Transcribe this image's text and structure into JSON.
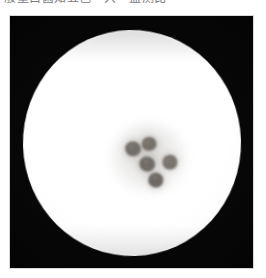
{
  "caption": {
    "text": "般量白菌知五色一只—监测比",
    "note": "clipped-top-text-line"
  },
  "photo": {
    "subject": "petri-dish-bacterial-culture",
    "frame_color": "#040404",
    "dish_color": "#ffffff",
    "colony_color": "#6f6a66",
    "background_color": "#ffffff",
    "colony_count": 5
  },
  "colonies": [
    {
      "name": "colony-upper-left",
      "cx": 123,
      "cy": 133,
      "r": 8.0,
      "color": "#716c67",
      "rot": 8
    },
    {
      "name": "colony-upper-right",
      "cx": 139,
      "cy": 128,
      "r": 7.4,
      "color": "#767069",
      "rot": -12
    },
    {
      "name": "colony-center",
      "cx": 137,
      "cy": 148,
      "r": 7.8,
      "color": "#6e6964",
      "rot": 20
    },
    {
      "name": "colony-right",
      "cx": 160,
      "cy": 146,
      "r": 7.6,
      "color": "#79736d",
      "rot": -5
    },
    {
      "name": "colony-lower",
      "cx": 146,
      "cy": 164,
      "r": 7.7,
      "color": "#6c6762",
      "rot": 14
    }
  ]
}
